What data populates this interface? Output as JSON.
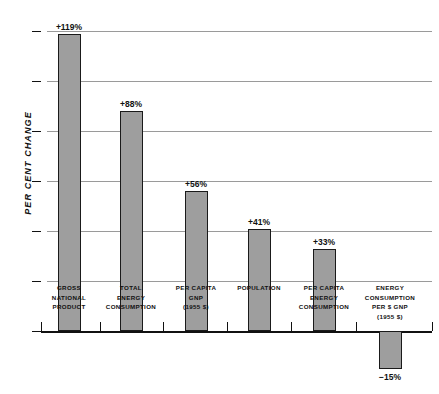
{
  "chart_data": {
    "type": "bar",
    "title": "",
    "xlabel": "",
    "ylabel": "PER CENT CHANGE",
    "ylim": [
      -20,
      130
    ],
    "grid": true,
    "legend": "none",
    "yticks": [
      0,
      20,
      40,
      60,
      80,
      100,
      120
    ],
    "ytick_labels": [
      "0",
      "20",
      "40",
      "60",
      "80",
      "100",
      "120"
    ],
    "categories": [
      "GROSS\nNATIONAL\nPRODUCT",
      "TOTAL\nENERGY\nCONSUMPTION",
      "PER CAPITA\nGNP\n(1955 $)",
      "POPULATION",
      "PER CAPITA\nENERGY\nCONSUMPTION",
      "ENERGY\nCONSUMPTION\nPER $ GNP\n(1955 $)"
    ],
    "values": [
      119,
      88,
      56,
      41,
      33,
      -15
    ],
    "value_labels": [
      "+119%",
      "+88%",
      "+56%",
      "+41%",
      "+33%",
      "−15%"
    ],
    "bar_color": "#9e9e9e",
    "bar_edge_color": "#1a1a1a",
    "gridline_color": "#9a9a9a",
    "axis_color": "#111111",
    "background_color": "#ffffff"
  },
  "axis": {
    "y_title": "PER CENT CHANGE"
  }
}
